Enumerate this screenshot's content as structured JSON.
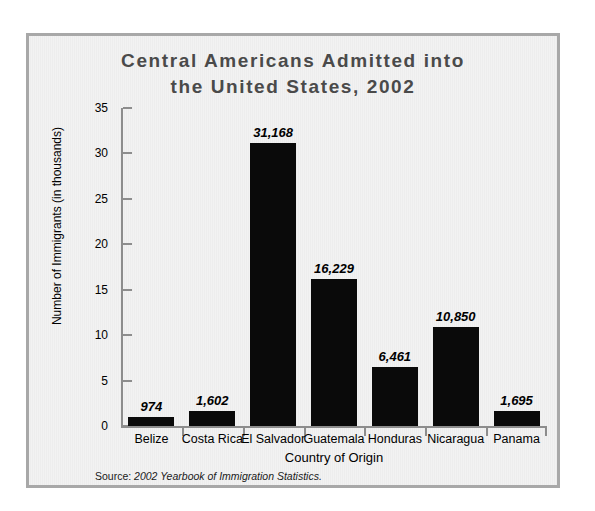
{
  "chart_data": {
    "type": "bar",
    "title": "Central Americans Admitted into the United States, 2002",
    "title_line1": "Central Americans Admitted into",
    "title_line2": "the United States, 2002",
    "xlabel": "Country of Origin",
    "ylabel": "Number of Immigrants (in thousands)",
    "categories": [
      "Belize",
      "Costa Rica",
      "El Salvador",
      "Guatemala",
      "Honduras",
      "Nicaragua",
      "Panama"
    ],
    "values": [
      0.974,
      1.602,
      31.168,
      16.229,
      6.461,
      10.85,
      1.695
    ],
    "value_labels": [
      "974",
      "1,602",
      "31,168",
      "16,229",
      "6,461",
      "10,850",
      "1,695"
    ],
    "ylim": [
      0,
      35
    ],
    "yticks": [
      0,
      5,
      10,
      15,
      20,
      25,
      30,
      35
    ],
    "ytick_labels": [
      "0",
      "5",
      "10",
      "15",
      "20",
      "25",
      "30",
      "35"
    ],
    "grid": false,
    "legend": "none",
    "bar_color": "#0a0a0a",
    "panel_color": "#f0f0f0",
    "frame_color": "#a8a8a8",
    "title_color": "#4a4a4a"
  },
  "source": {
    "label": "Source:",
    "text": " 2002 Yearbook of Immigration Statistics."
  }
}
